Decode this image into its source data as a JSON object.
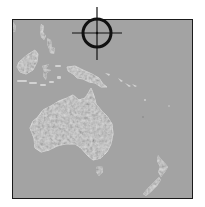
{
  "map": {
    "region": "Oceania",
    "colors": {
      "ocean": "#a3a3a3",
      "land": "#d8d8d8",
      "land_highlight": "#ececec",
      "land_shadow": "#8c8c8c",
      "frame": "#1a1a1a",
      "crosshair": "#111111"
    },
    "landmasses": [
      {
        "name": "Australia"
      },
      {
        "name": "New Guinea"
      },
      {
        "name": "New Zealand"
      },
      {
        "name": "Tasmania"
      },
      {
        "name": "Borneo / Sulawesi area"
      },
      {
        "name": "Philippines area"
      },
      {
        "name": "Solomon Islands"
      }
    ],
    "marker": {
      "type": "crosshair-target",
      "center_x": 97,
      "center_y": 33,
      "radius": 14
    }
  }
}
